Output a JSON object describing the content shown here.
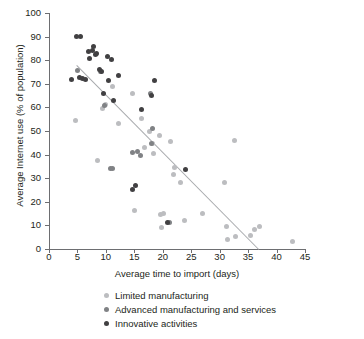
{
  "chart_data": {
    "type": "scatter",
    "title": "",
    "xlabel": "Average time to import (days)",
    "ylabel": "Average Internet use (% of population)",
    "xlim": [
      0,
      45
    ],
    "ylim": [
      0,
      100
    ],
    "xticks": [
      0,
      5,
      10,
      15,
      20,
      25,
      30,
      35,
      40,
      45
    ],
    "yticks": [
      0,
      10,
      20,
      30,
      40,
      50,
      60,
      70,
      80,
      90,
      100
    ],
    "grid": false,
    "legend_position": "below",
    "colors": {
      "limited_manufacturing": "#bcbdc0",
      "advanced_manufacturing_and_services": "#808285",
      "innovative_activities": "#414042",
      "trendline": "#a7a9ac",
      "axis": "#6d6e71",
      "text": "#231f20"
    },
    "trendline": {
      "label": "linear fit",
      "x": [
        5.0,
        37.0
      ],
      "y": [
        78.0,
        0.0
      ]
    },
    "series": [
      {
        "name": "Limited manufacturing",
        "color": "#bcbdc0",
        "points": [
          [
            4.6,
            54.5
          ],
          [
            8.6,
            37.7
          ],
          [
            9.4,
            59.4
          ],
          [
            10.0,
            61.2
          ],
          [
            11.2,
            68.7
          ],
          [
            12.2,
            53.2
          ],
          [
            14.6,
            66.1
          ],
          [
            15.0,
            16.4
          ],
          [
            16.2,
            55.5
          ],
          [
            16.8,
            43.2
          ],
          [
            17.6,
            50.0
          ],
          [
            18.2,
            44.6
          ],
          [
            18.4,
            40.4
          ],
          [
            19.4,
            48.1
          ],
          [
            19.6,
            14.6
          ],
          [
            19.8,
            9.2
          ],
          [
            20.2,
            15.0
          ],
          [
            21.4,
            45.4
          ],
          [
            21.8,
            31.6
          ],
          [
            22.0,
            34.7
          ],
          [
            23.2,
            28.3
          ],
          [
            23.8,
            11.9
          ],
          [
            27.0,
            15.2
          ],
          [
            30.8,
            28.1
          ],
          [
            31.2,
            9.5
          ],
          [
            31.4,
            4.0
          ],
          [
            32.6,
            46.1
          ],
          [
            32.8,
            5.5
          ],
          [
            35.4,
            5.7
          ],
          [
            36.2,
            8.2
          ],
          [
            37.0,
            9.4
          ],
          [
            42.8,
            3.3
          ]
        ]
      },
      {
        "name": "Advanced manufacturing and services",
        "color": "#808285",
        "points": [
          [
            5.0,
            75.5
          ],
          [
            9.0,
            75.2
          ],
          [
            9.8,
            61.0
          ],
          [
            10.8,
            34.2
          ],
          [
            11.2,
            34.3
          ],
          [
            14.6,
            41.0
          ],
          [
            15.6,
            41.2
          ],
          [
            16.0,
            39.8
          ],
          [
            17.8,
            65.8
          ],
          [
            18.0,
            44.5
          ],
          [
            18.2,
            51.0
          ],
          [
            21.2,
            11.1
          ]
        ]
      },
      {
        "name": "Innovative activities",
        "color": "#414042",
        "points": [
          [
            3.9,
            72.0
          ],
          [
            4.9,
            90.2
          ],
          [
            5.6,
            90.2
          ],
          [
            5.4,
            72.6
          ],
          [
            5.9,
            72.4
          ],
          [
            6.5,
            71.8
          ],
          [
            6.9,
            83.6
          ],
          [
            7.2,
            80.9
          ],
          [
            7.6,
            83.9
          ],
          [
            7.9,
            85.6
          ],
          [
            8.2,
            82.3
          ],
          [
            8.4,
            82.9
          ],
          [
            8.8,
            76.0
          ],
          [
            9.2,
            75.4
          ],
          [
            9.6,
            65.7
          ],
          [
            10.2,
            81.6
          ],
          [
            10.4,
            71.5
          ],
          [
            11.0,
            80.2
          ],
          [
            11.4,
            62.9
          ],
          [
            12.2,
            73.5
          ],
          [
            14.6,
            25.2
          ],
          [
            15.2,
            27.0
          ],
          [
            16.2,
            59.2
          ],
          [
            18.0,
            65.2
          ],
          [
            18.6,
            71.6
          ],
          [
            20.8,
            11.2
          ],
          [
            24.0,
            33.8
          ]
        ]
      }
    ]
  },
  "legend": {
    "items": [
      {
        "label": "Limited manufacturing",
        "color": "#bcbdc0"
      },
      {
        "label": "Advanced manufacturing and services",
        "color": "#808285"
      },
      {
        "label": "Innovative activities",
        "color": "#414042"
      }
    ]
  }
}
